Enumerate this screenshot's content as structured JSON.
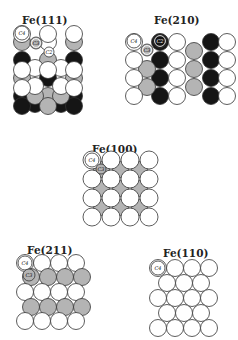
{
  "colors": {
    "white": "#ffffff",
    "gray": "#b4b4b4",
    "black": "#151515",
    "stroke": "#333333"
  },
  "panels": [
    {
      "id": "fe111",
      "title": "Fe(111)",
      "title_x": 22,
      "title_y": 14,
      "origin": [
        14,
        33
      ],
      "r": 8.5,
      "circles": [
        {
          "x": 8,
          "y": 8,
          "c": "gray"
        },
        {
          "x": 34,
          "y": 8,
          "c": "white"
        },
        {
          "x": 60,
          "y": 8,
          "c": "gray"
        },
        {
          "x": 8,
          "y": 26,
          "c": "black"
        },
        {
          "x": 34,
          "y": 26,
          "c": "gray"
        },
        {
          "x": 60,
          "y": 26,
          "c": "black"
        },
        {
          "x": 21,
          "y": 34,
          "c": "white"
        },
        {
          "x": 47,
          "y": 34,
          "c": "white"
        },
        {
          "x": 8,
          "y": 44,
          "c": "gray"
        },
        {
          "x": 34,
          "y": 44,
          "c": "black"
        },
        {
          "x": 60,
          "y": 44,
          "c": "gray"
        },
        {
          "x": 8,
          "y": 62,
          "c": "black"
        },
        {
          "x": 34,
          "y": 62,
          "c": "gray"
        },
        {
          "x": 60,
          "y": 62,
          "c": "black"
        },
        {
          "x": 21,
          "y": 52,
          "c": "white"
        },
        {
          "x": 47,
          "y": 52,
          "c": "white"
        },
        {
          "x": 21,
          "y": 70,
          "c": "black"
        },
        {
          "x": 47,
          "y": 70,
          "c": "black"
        },
        {
          "x": 8,
          "y": 0,
          "c": "white"
        },
        {
          "x": 34,
          "y": 0,
          "c": "white"
        },
        {
          "x": 60,
          "y": 0,
          "c": "white"
        },
        {
          "x": 8,
          "y": 36,
          "c": "white"
        },
        {
          "x": 34,
          "y": 36,
          "c": "white"
        },
        {
          "x": 60,
          "y": 36,
          "c": "white"
        },
        {
          "x": 8,
          "y": 54,
          "c": "white"
        },
        {
          "x": 60,
          "y": 54,
          "c": "white"
        },
        {
          "x": 21,
          "y": 62,
          "c": "gray"
        },
        {
          "x": 47,
          "y": 62,
          "c": "gray"
        },
        {
          "x": 8,
          "y": 72,
          "c": "black"
        },
        {
          "x": 34,
          "y": 72,
          "c": "gray"
        },
        {
          "x": 60,
          "y": 72,
          "c": "black"
        }
      ],
      "sites": [
        {
          "label": "C4",
          "x": 8,
          "y": 0,
          "r": 7,
          "fill": "white"
        },
        {
          "label": "C3",
          "x": 22,
          "y": 10,
          "r": 6,
          "fill": "gray",
          "ring": true
        },
        {
          "label": "C2",
          "x": 35,
          "y": 19,
          "r": 5,
          "fill": "white"
        }
      ]
    },
    {
      "id": "fe210",
      "title": "Fe(210)",
      "title_x": 154,
      "title_y": 14,
      "origin": [
        126,
        33
      ],
      "r": 8.5,
      "circles": [
        {
          "x": 8,
          "y": 8,
          "c": "white"
        },
        {
          "x": 34,
          "y": 8,
          "c": "black"
        },
        {
          "x": 51,
          "y": 8,
          "c": "white"
        },
        {
          "x": 85,
          "y": 8,
          "c": "black"
        },
        {
          "x": 68,
          "y": 17,
          "c": "gray"
        },
        {
          "x": 101,
          "y": 8,
          "c": "white"
        },
        {
          "x": 8,
          "y": 26,
          "c": "white"
        },
        {
          "x": 34,
          "y": 26,
          "c": "black"
        },
        {
          "x": 51,
          "y": 26,
          "c": "white"
        },
        {
          "x": 85,
          "y": 26,
          "c": "black"
        },
        {
          "x": 101,
          "y": 26,
          "c": "white"
        },
        {
          "x": 21,
          "y": 35,
          "c": "gray"
        },
        {
          "x": 68,
          "y": 35,
          "c": "gray"
        },
        {
          "x": 8,
          "y": 44,
          "c": "white"
        },
        {
          "x": 34,
          "y": 44,
          "c": "black"
        },
        {
          "x": 51,
          "y": 44,
          "c": "white"
        },
        {
          "x": 85,
          "y": 44,
          "c": "black"
        },
        {
          "x": 101,
          "y": 44,
          "c": "white"
        },
        {
          "x": 21,
          "y": 53,
          "c": "gray"
        },
        {
          "x": 68,
          "y": 53,
          "c": "gray"
        },
        {
          "x": 8,
          "y": 62,
          "c": "white"
        },
        {
          "x": 34,
          "y": 62,
          "c": "black"
        },
        {
          "x": 51,
          "y": 62,
          "c": "white"
        },
        {
          "x": 85,
          "y": 62,
          "c": "black"
        },
        {
          "x": 101,
          "y": 62,
          "c": "white"
        }
      ],
      "sites": [
        {
          "label": "C4",
          "x": 8,
          "y": 8,
          "r": 7,
          "fill": "white"
        },
        {
          "label": "C3",
          "x": 21,
          "y": 17,
          "r": 6,
          "fill": "gray",
          "ring": true
        },
        {
          "label": "C2",
          "x": 34,
          "y": 8,
          "r": 7,
          "fill": "black",
          "ring": true
        }
      ]
    },
    {
      "id": "fe100",
      "title": "Fe(100)",
      "title_x": 92,
      "title_y": 143,
      "origin": [
        83,
        151
      ],
      "r": 9,
      "grid": {
        "cols": 4,
        "rows": 4,
        "pitch": 19
      },
      "sites": [
        {
          "label": "C4",
          "x": 9,
          "y": 9,
          "r": 7,
          "fill": "white"
        },
        {
          "label": "C3",
          "x": 18,
          "y": 18,
          "r": 5,
          "fill": "gray"
        }
      ]
    },
    {
      "id": "fe211",
      "title": "Fe(211)",
      "title_x": 27,
      "title_y": 244,
      "origin": [
        17,
        255
      ],
      "r": 8.5,
      "rows": [
        {
          "y": 8,
          "x0": 8,
          "n": 4,
          "c": "white"
        },
        {
          "y": 22,
          "x0": 14,
          "n": 4,
          "c": "gray"
        },
        {
          "y": 37,
          "x0": 8,
          "n": 4,
          "c": "white"
        },
        {
          "y": 52,
          "x0": 14,
          "n": 4,
          "c": "gray"
        },
        {
          "y": 66,
          "x0": 8,
          "n": 4,
          "c": "white"
        }
      ],
      "pitch": 17,
      "sites": [
        {
          "label": "C4",
          "x": 8,
          "y": 8,
          "r": 7,
          "fill": "white"
        },
        {
          "label": "C3",
          "x": 12,
          "y": 20,
          "r": 6,
          "fill": "gray"
        }
      ]
    },
    {
      "id": "fe110",
      "title": "Fe(110)",
      "title_x": 163,
      "title_y": 247,
      "origin": [
        150,
        260
      ],
      "r": 8.5,
      "rows": [
        {
          "y": 8,
          "x0": 8,
          "n": 4,
          "c": "white"
        },
        {
          "y": 23,
          "x0": 17,
          "n": 3,
          "c": "white"
        },
        {
          "y": 38,
          "x0": 8,
          "n": 4,
          "c": "white"
        },
        {
          "y": 53,
          "x0": 17,
          "n": 3,
          "c": "white"
        },
        {
          "y": 68,
          "x0": 8,
          "n": 4,
          "c": "white"
        }
      ],
      "pitch": 17,
      "sites": [
        {
          "label": "C4",
          "x": 8,
          "y": 8,
          "r": 7,
          "fill": "white"
        }
      ]
    }
  ]
}
